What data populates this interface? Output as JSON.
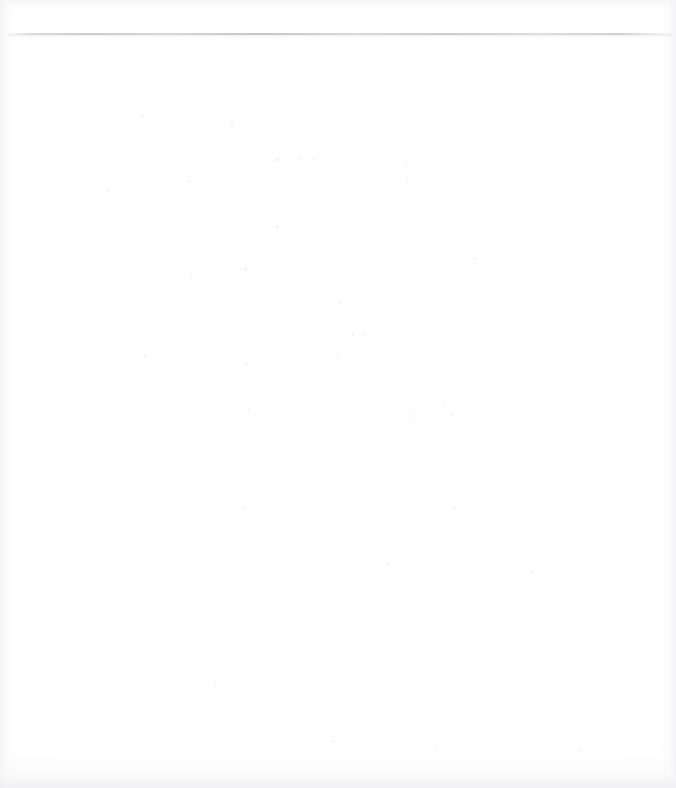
{
  "page": {
    "kind": "scanned-blank-page",
    "width": 676,
    "height": 788,
    "background_color": "#ffffff",
    "paper_tone": "#fdfdfd",
    "visible_text": "",
    "body_text": "",
    "header_text": "",
    "footer_text": "",
    "page_number": ""
  },
  "rule": {
    "name": "top-horizontal-rule",
    "color": "#c6c6cc",
    "left": 8,
    "top": 33,
    "width": 664,
    "height": 2
  },
  "artifacts": {
    "edge_shadow_color": "#f3f3f5",
    "speck_color": "#e4e4e8",
    "specks": [
      {
        "x": 141,
        "y": 115,
        "d": 2
      },
      {
        "x": 231,
        "y": 124,
        "d": 2
      },
      {
        "x": 262,
        "y": 123,
        "d": 1
      },
      {
        "x": 276,
        "y": 158,
        "d": 3
      },
      {
        "x": 276,
        "y": 225,
        "d": 3
      },
      {
        "x": 300,
        "y": 158,
        "d": 2
      },
      {
        "x": 313,
        "y": 158,
        "d": 2
      },
      {
        "x": 405,
        "y": 164,
        "d": 2
      },
      {
        "x": 188,
        "y": 180,
        "d": 2
      },
      {
        "x": 406,
        "y": 180,
        "d": 2
      },
      {
        "x": 107,
        "y": 190,
        "d": 2
      },
      {
        "x": 474,
        "y": 258,
        "d": 2
      },
      {
        "x": 244,
        "y": 268,
        "d": 3
      },
      {
        "x": 190,
        "y": 276,
        "d": 2
      },
      {
        "x": 339,
        "y": 301,
        "d": 2
      },
      {
        "x": 352,
        "y": 334,
        "d": 2
      },
      {
        "x": 364,
        "y": 334,
        "d": 2
      },
      {
        "x": 337,
        "y": 356,
        "d": 2
      },
      {
        "x": 144,
        "y": 355,
        "d": 2
      },
      {
        "x": 245,
        "y": 363,
        "d": 2
      },
      {
        "x": 444,
        "y": 401,
        "d": 2
      },
      {
        "x": 248,
        "y": 409,
        "d": 2
      },
      {
        "x": 409,
        "y": 415,
        "d": 2
      },
      {
        "x": 451,
        "y": 414,
        "d": 2
      },
      {
        "x": 244,
        "y": 507,
        "d": 2
      },
      {
        "x": 453,
        "y": 507,
        "d": 2
      },
      {
        "x": 387,
        "y": 563,
        "d": 2
      },
      {
        "x": 531,
        "y": 571,
        "d": 2
      },
      {
        "x": 214,
        "y": 682,
        "d": 2
      },
      {
        "x": 332,
        "y": 740,
        "d": 2
      },
      {
        "x": 436,
        "y": 745,
        "d": 2
      },
      {
        "x": 578,
        "y": 750,
        "d": 2
      }
    ]
  }
}
